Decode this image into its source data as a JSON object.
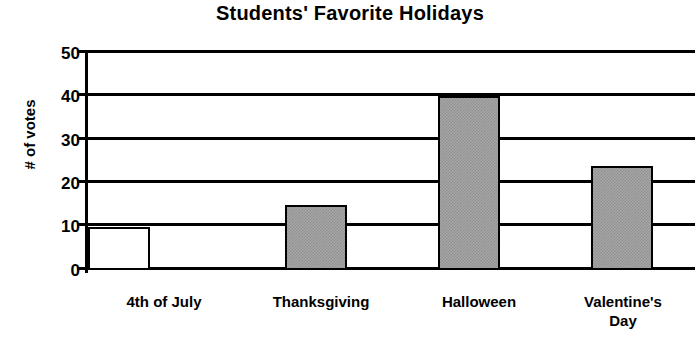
{
  "chart_data": {
    "type": "bar",
    "title": "Students' Favorite Holidays",
    "xlabel": "",
    "ylabel": "# of votes",
    "categories": [
      "4th of July",
      "Thanksgiving",
      "Halloween",
      "Valentine's Day"
    ],
    "values": [
      10,
      15,
      40,
      24
    ],
    "ylim": [
      0,
      50
    ],
    "yticks": [
      0,
      10,
      20,
      30,
      40,
      50
    ],
    "ytick_labels": [
      "0",
      "10",
      "20",
      "30",
      "40",
      "50"
    ],
    "grid": true,
    "legend": false,
    "bar_fills": [
      "white",
      "gray-hatch",
      "gray-hatch",
      "gray-hatch"
    ],
    "colors": {
      "bar_fill": "#a6a6a6",
      "bar_border": "#000000",
      "axis": "#000000",
      "gridline": "#000000",
      "background": "#ffffff",
      "text": "#000000"
    }
  },
  "labels": {
    "y_tick_50": "50",
    "y_tick_40": "40",
    "y_tick_30": "30",
    "y_tick_20": "20",
    "y_tick_10": "10",
    "y_tick_0": "0",
    "cat_1": "4th of July",
    "cat_2": "Thanksgiving",
    "cat_3": "Halloween",
    "cat_4_line1": "Valentine's",
    "cat_4_line2": "Day"
  }
}
